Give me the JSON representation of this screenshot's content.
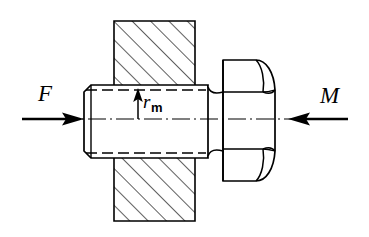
{
  "figure": {
    "background_color": "#ffffff",
    "line_color": "#000000",
    "labels": {
      "force": "F",
      "moment": "M",
      "radius_symbol": "r",
      "radius_subscript": "m"
    },
    "annotations": [
      {
        "name": "force-label",
        "text": "F",
        "x": 38,
        "y": 82
      },
      {
        "name": "moment-label",
        "text": "M",
        "x": 320,
        "y": 84
      },
      {
        "name": "mean-radius-label",
        "text": "rm",
        "x": 143,
        "y": 92
      }
    ],
    "geometry": {
      "plate": {
        "left": 114,
        "top": 21,
        "right": 195,
        "bottom": 221,
        "hatch_angle_deg": 45,
        "hatch_spacing": 13
      },
      "shank": {
        "left": 84,
        "top": 85,
        "right": 208,
        "bottom": 158,
        "chamfer": 7
      },
      "core_line_top_y": 90,
      "core_line_bottom_y": 153,
      "head": {
        "left": 223,
        "top": 60,
        "right": 275,
        "bottom": 181
      },
      "axis_y": 119,
      "force_arrow": {
        "x_start": 22,
        "x_end": 84,
        "direction": "right"
      },
      "moment_arrow": {
        "x_start": 348,
        "x_end": 288,
        "direction": "left"
      },
      "radius_arrow": {
        "x": 138,
        "y_start": 119,
        "y_end": 89,
        "direction": "up"
      }
    }
  }
}
